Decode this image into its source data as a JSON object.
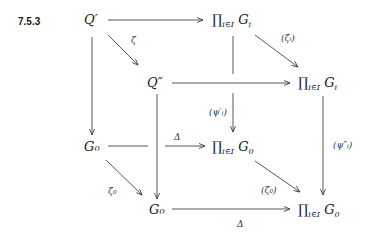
{
  "equation_number": "7.5.3",
  "nodes": {
    "q_prime": "Q′",
    "prod_gi_top": {
      "symbol": "∏",
      "index": "i∈I",
      "term": "G",
      "term_sub": "i"
    },
    "q_double_prime": "Q″",
    "prod_gi_mid": {
      "symbol": "∏",
      "index": "i∈I",
      "term": "G",
      "term_sub": "i"
    },
    "g0_left": "G₀",
    "prod_g0_mid": {
      "symbol": "∏",
      "index": "i∈I",
      "term": "G",
      "term_sub": "0"
    },
    "g0_bottom": "G₀",
    "prod_g0_bottom": {
      "symbol": "∏",
      "index": "i∈I",
      "term": "G",
      "term_sub": "0"
    }
  },
  "arrows": {
    "zeta": "ζ",
    "zeta_i": "(ζᵢ)",
    "psi_prime_i": "(ψ′ᵢ)",
    "psi_double_prime_i": "(ψ″ᵢ)",
    "delta_mid": "Δ",
    "delta_bottom": "Δ",
    "zeta_0": "ζ₀",
    "zeta_0_paren": "(ζ₀)"
  }
}
